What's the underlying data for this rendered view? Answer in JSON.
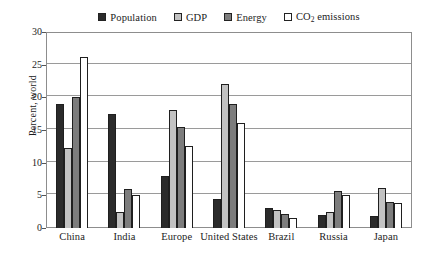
{
  "chart_data": {
    "type": "bar",
    "title": "",
    "xlabel": "",
    "ylabel": "Percent, world",
    "ylim": [
      0,
      30
    ],
    "ytick_values": [
      0,
      5,
      10,
      15,
      20,
      25,
      30
    ],
    "ytick_labels": [
      "0",
      "5",
      "10",
      "15",
      "20",
      "25",
      "30"
    ],
    "grid": true,
    "legend_position": "top",
    "categories": [
      "China",
      "India",
      "Europe",
      "United States",
      "Brazil",
      "Russia",
      "Japan"
    ],
    "series": [
      {
        "name": "Population",
        "color": "#2b2b2b",
        "values": [
          19.0,
          17.4,
          8.0,
          4.5,
          3.0,
          2.0,
          1.8
        ]
      },
      {
        "name": "GDP",
        "color": "#c2c2c2",
        "values": [
          12.2,
          2.5,
          18.0,
          22.1,
          2.8,
          2.4,
          6.1
        ]
      },
      {
        "name": "Energy",
        "color": "#7d7d7d",
        "values": [
          20.0,
          5.9,
          15.5,
          19.0,
          2.2,
          5.6,
          4.0
        ]
      },
      {
        "name": "CO2 emissions",
        "color": "#ffffff",
        "values": [
          26.2,
          5.0,
          12.5,
          16.1,
          1.5,
          5.0,
          3.8
        ]
      }
    ]
  },
  "legend": {
    "items": [
      {
        "label": "Population",
        "label_sub": "",
        "label_tail": ""
      },
      {
        "label": "GDP",
        "label_sub": "",
        "label_tail": ""
      },
      {
        "label": "Energy",
        "label_sub": "",
        "label_tail": ""
      },
      {
        "label": "CO",
        "label_sub": "2",
        "label_tail": " emissions"
      }
    ]
  }
}
